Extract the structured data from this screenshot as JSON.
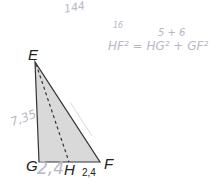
{
  "diagram": {
    "type": "right-triangle",
    "fill_color": "#d9d9d9",
    "stroke_color": "#333333",
    "vertices": {
      "E": {
        "label": "E",
        "x": 35,
        "y": 62
      },
      "G": {
        "label": "G",
        "x": 39,
        "y": 162
      },
      "F": {
        "label": "F",
        "x": 100,
        "y": 162
      },
      "H": {
        "label": "H",
        "x": 69,
        "y": 162
      }
    },
    "segments": [
      {
        "from": "E",
        "to": "G",
        "style": "solid"
      },
      {
        "from": "G",
        "to": "F",
        "style": "solid"
      },
      {
        "from": "F",
        "to": "E",
        "style": "solid"
      },
      {
        "from": "E",
        "to": "H",
        "style": "dashed"
      }
    ],
    "printed_measure": {
      "segment": "HF",
      "value": "2,4"
    }
  },
  "handwriting": {
    "top_note": "144",
    "side_note": "7,35",
    "base_note": "2,4",
    "formula_top": "5 + 6",
    "formula_small": "16",
    "formula_main": "HF² = HG² + GF²"
  }
}
